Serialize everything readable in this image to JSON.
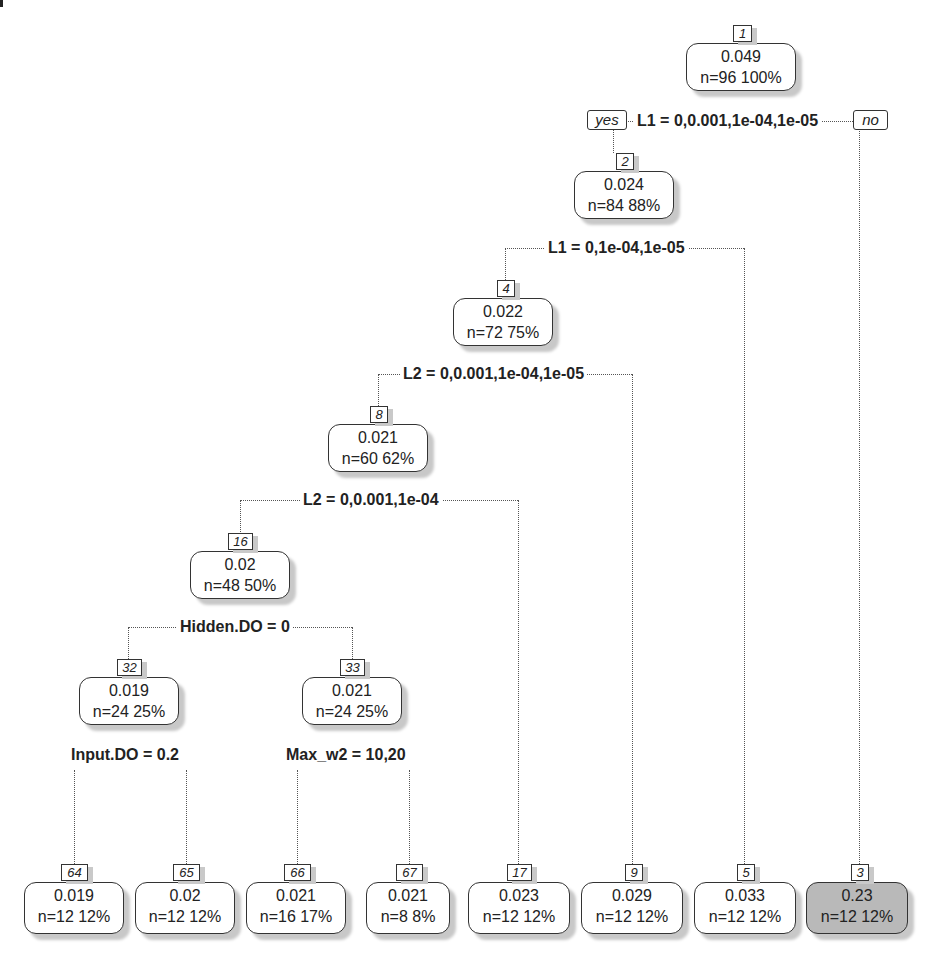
{
  "diagram": {
    "type": "regression-tree",
    "branch_labels": {
      "yes": "yes",
      "no": "no"
    },
    "nodes": [
      {
        "id": "1",
        "value": "0.049",
        "stats": "n=96  100%",
        "split": "L1 = 0,0.001,1e-04,1e-05"
      },
      {
        "id": "2",
        "value": "0.024",
        "stats": "n=84  88%",
        "split": "L1 = 0,1e-04,1e-05"
      },
      {
        "id": "4",
        "value": "0.022",
        "stats": "n=72  75%",
        "split": "L2 = 0,0.001,1e-04,1e-05"
      },
      {
        "id": "8",
        "value": "0.021",
        "stats": "n=60  62%",
        "split": "L2 = 0,0.001,1e-04"
      },
      {
        "id": "16",
        "value": "0.02",
        "stats": "n=48  50%",
        "split": "Hidden.DO = 0"
      },
      {
        "id": "32",
        "value": "0.019",
        "stats": "n=24  25%",
        "split": "Input.DO = 0.2"
      },
      {
        "id": "33",
        "value": "0.021",
        "stats": "n=24  25%",
        "split": "Max_w2 = 10,20"
      },
      {
        "id": "64",
        "value": "0.019",
        "stats": "n=12  12%"
      },
      {
        "id": "65",
        "value": "0.02",
        "stats": "n=12  12%"
      },
      {
        "id": "66",
        "value": "0.021",
        "stats": "n=16  17%"
      },
      {
        "id": "67",
        "value": "0.021",
        "stats": "n=8  8%"
      },
      {
        "id": "17",
        "value": "0.023",
        "stats": "n=12  12%"
      },
      {
        "id": "9",
        "value": "0.029",
        "stats": "n=12  12%"
      },
      {
        "id": "5",
        "value": "0.033",
        "stats": "n=12  12%"
      },
      {
        "id": "3",
        "value": "0.23",
        "stats": "n=12  12%",
        "highlighted": true
      }
    ],
    "colors": {
      "leaf_fill": "#ffffff",
      "highlight_fill": "#b9b9b9",
      "border": "#333333",
      "shadow": "#c8c8c8"
    }
  }
}
